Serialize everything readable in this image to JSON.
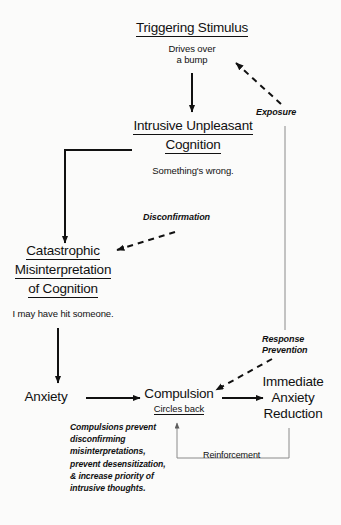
{
  "diagram": {
    "title_node": {
      "label": "Triggering Stimulus",
      "underlined": true,
      "example_line1": "Drives over",
      "example_line2": "a bump"
    },
    "intrusive_node": {
      "label_line1": "Intrusive Unpleasant",
      "label_line2": "Cognition",
      "underlined": true,
      "example": "Something's wrong."
    },
    "catastrophic_node": {
      "label_line1": "Catastrophic",
      "label_line2": "Misinterpretation",
      "label_line3": "of Cognition",
      "underlined": true,
      "example": "I may have hit someone."
    },
    "anxiety_node": {
      "label": "Anxiety"
    },
    "compulsion_node": {
      "label": "Compulsion",
      "underlined": true,
      "example": "Circles back"
    },
    "reduction_node": {
      "label_line1": "Immediate",
      "label_line2": "Anxiety",
      "label_line3": "Reduction"
    },
    "edge_labels": {
      "exposure": "Exposure",
      "disconfirmation": "Disconfirmation",
      "response_prevention_line1": "Response",
      "response_prevention_line2": "Prevention",
      "reinforcement": "Reinforcement"
    },
    "note": {
      "line1": "Compulsions prevent",
      "line2": "disconfirming",
      "line3": "misinterpretations,",
      "line4": "prevent desensitization,",
      "line5": "& increase priority of",
      "line6": "intrusive thoughts."
    },
    "colors": {
      "ink": "#111111",
      "background": "#fbfbfa",
      "thin_line": "#8a8a8a"
    }
  }
}
